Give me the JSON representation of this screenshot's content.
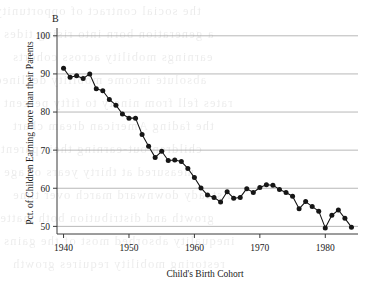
{
  "figure": {
    "panel_letter": "B"
  },
  "chart_data": {
    "type": "line",
    "title": "",
    "subtitle": "",
    "panel_label": "B",
    "xlabel": "Child's Birth Cohort",
    "ylabel": "Pct. of Children Earning more than their Parents",
    "xlim": [
      1939,
      1985
    ],
    "ylim": [
      48,
      101
    ],
    "xticks": [
      1940,
      1950,
      1960,
      1970,
      1980
    ],
    "xticklabels": [
      "1940",
      "1950",
      "1960",
      "1970",
      "1980"
    ],
    "yticks": [
      50,
      60,
      70,
      80,
      90,
      100
    ],
    "yticklabels": [
      "50",
      "60",
      "70",
      "80",
      "90",
      "100"
    ],
    "grid": "horizontal",
    "legend": "none",
    "marker": "filled-circle",
    "series": [
      {
        "name": "Pct. of Children Earning more than their Parents",
        "color": "#161616",
        "x": [
          1940,
          1941,
          1942,
          1943,
          1944,
          1945,
          1946,
          1947,
          1948,
          1949,
          1950,
          1951,
          1952,
          1953,
          1954,
          1955,
          1956,
          1957,
          1958,
          1959,
          1960,
          1961,
          1962,
          1963,
          1964,
          1965,
          1966,
          1967,
          1968,
          1969,
          1970,
          1971,
          1972,
          1973,
          1974,
          1975,
          1976,
          1977,
          1978,
          1979,
          1980,
          1981,
          1982,
          1983,
          1984
        ],
        "values": [
          91.5,
          89.1,
          89.5,
          88.8,
          90.0,
          86.1,
          85.6,
          83.3,
          81.8,
          79.5,
          78.4,
          78.4,
          74.1,
          71.0,
          68.1,
          69.7,
          67.3,
          67.4,
          67.0,
          65.2,
          62.8,
          60.1,
          58.2,
          57.6,
          56.4,
          59.1,
          57.4,
          57.6,
          59.9,
          58.9,
          60.2,
          60.9,
          60.8,
          59.7,
          58.9,
          57.9,
          54.6,
          56.5,
          55.2,
          54.0,
          49.6,
          52.9,
          54.3,
          52.1,
          49.8
        ]
      }
    ]
  },
  "bleed_text": {
    "lines": [
      "the social contract of opportunity",
      "a generation born into rising tides",
      "earnings mobility across cohorts",
      "absolute income mobility declined",
      "rates fell from ninety to fifty percent",
      "the fading American dream chart",
      "children out-earning their parents",
      "measured at thirty years of age",
      "a steady downward march over time",
      "growth and distribution both matter",
      "inequality absorbed most of the gains",
      "restoring mobility requires growth"
    ]
  }
}
